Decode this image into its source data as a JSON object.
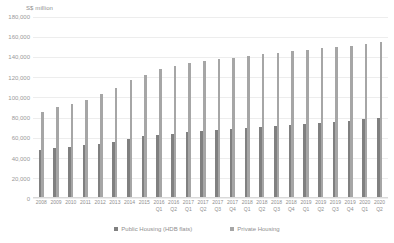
{
  "chart_data": {
    "type": "bar",
    "title": "",
    "ylabel": "S$ million",
    "xlabel": "",
    "ylim": [
      0,
      180000
    ],
    "yticks": [
      "180,000",
      "160,000",
      "140,000",
      "120,000",
      "100,000",
      "80,000",
      "60,000",
      "40,000",
      "20,000",
      "0"
    ],
    "ytick_values": [
      180000,
      160000,
      140000,
      120000,
      100000,
      80000,
      60000,
      40000,
      20000,
      0
    ],
    "grid": true,
    "legend_position": "bottom",
    "categories": [
      {
        "year": "2008",
        "quarter": ""
      },
      {
        "year": "2009",
        "quarter": ""
      },
      {
        "year": "2010",
        "quarter": ""
      },
      {
        "year": "2011",
        "quarter": ""
      },
      {
        "year": "2012",
        "quarter": ""
      },
      {
        "year": "2013",
        "quarter": ""
      },
      {
        "year": "2014",
        "quarter": ""
      },
      {
        "year": "2015",
        "quarter": ""
      },
      {
        "year": "2016",
        "quarter": "Q1"
      },
      {
        "year": "2016",
        "quarter": "Q2"
      },
      {
        "year": "2017",
        "quarter": "Q1"
      },
      {
        "year": "2017",
        "quarter": "Q2"
      },
      {
        "year": "2017",
        "quarter": "Q3"
      },
      {
        "year": "2017",
        "quarter": "Q4"
      },
      {
        "year": "2018",
        "quarter": "Q1"
      },
      {
        "year": "2018",
        "quarter": "Q2"
      },
      {
        "year": "2018",
        "quarter": "Q3"
      },
      {
        "year": "2018",
        "quarter": "Q4"
      },
      {
        "year": "2019",
        "quarter": "Q1"
      },
      {
        "year": "2019",
        "quarter": "Q2"
      },
      {
        "year": "2019",
        "quarter": "Q3"
      },
      {
        "year": "2019",
        "quarter": "Q4"
      },
      {
        "year": "2020",
        "quarter": "Q1"
      },
      {
        "year": "2020",
        "quarter": "Q2"
      }
    ],
    "series": [
      {
        "name": "Public Housing (HDB flats)",
        "color": "#808080",
        "values": [
          47000,
          49000,
          50000,
          52000,
          53000,
          55000,
          58000,
          61000,
          62000,
          63000,
          65000,
          66000,
          67000,
          68000,
          69000,
          70000,
          71000,
          72000,
          73000,
          74000,
          75000,
          76000,
          78000,
          79000
        ]
      },
      {
        "name": "Private Housing",
        "color": "#a6a6a6",
        "values": [
          85000,
          90000,
          93000,
          97000,
          103000,
          109000,
          117000,
          122000,
          128000,
          131000,
          134000,
          136000,
          138000,
          139000,
          141000,
          143000,
          144000,
          146000,
          147000,
          149000,
          150000,
          151000,
          153000,
          155000
        ]
      }
    ]
  }
}
